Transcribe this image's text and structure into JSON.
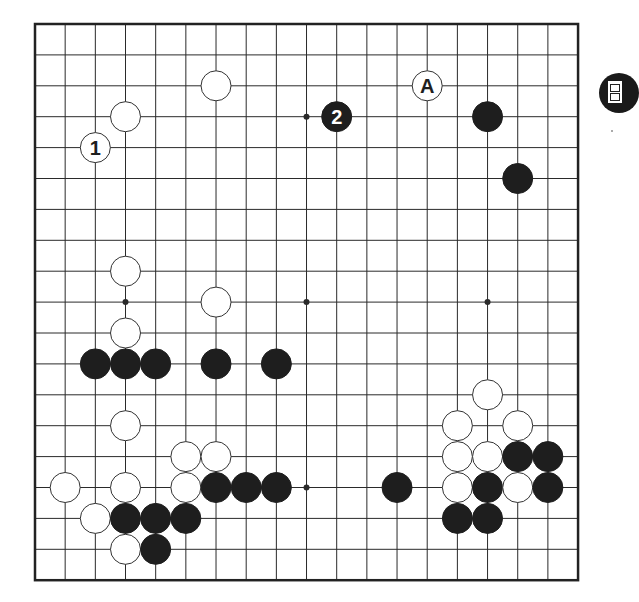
{
  "board": {
    "size": 19,
    "origin_x": 35,
    "origin_y": 24,
    "spacing_x": 30.17,
    "spacing_y": 30.9,
    "stone_radius": 15,
    "colors": {
      "line": "#2a2a2a",
      "border": "#222222",
      "black_stone": "#1e1e1e",
      "white_stone": "#ffffff",
      "white_stroke": "#333333",
      "background": "#ffffff"
    },
    "star_points": [
      [
        3,
        3
      ],
      [
        9,
        3
      ],
      [
        15,
        3
      ],
      [
        3,
        9
      ],
      [
        9,
        9
      ],
      [
        15,
        9
      ],
      [
        3,
        15
      ],
      [
        9,
        15
      ],
      [
        15,
        15
      ]
    ],
    "stones": [
      {
        "color": "white",
        "col": 6,
        "row": 2
      },
      {
        "color": "white",
        "col": 3,
        "row": 3
      },
      {
        "color": "white",
        "col": 2,
        "row": 4,
        "label": "1"
      },
      {
        "color": "black",
        "col": 10,
        "row": 3,
        "label": "2"
      },
      {
        "color": "white",
        "col": 13,
        "row": 2,
        "label": "A"
      },
      {
        "color": "black",
        "col": 15,
        "row": 3
      },
      {
        "color": "black",
        "col": 16,
        "row": 5
      },
      {
        "color": "white",
        "col": 3,
        "row": 8
      },
      {
        "color": "white",
        "col": 6,
        "row": 9
      },
      {
        "color": "white",
        "col": 3,
        "row": 10
      },
      {
        "color": "black",
        "col": 2,
        "row": 11
      },
      {
        "color": "black",
        "col": 3,
        "row": 11
      },
      {
        "color": "black",
        "col": 4,
        "row": 11
      },
      {
        "color": "black",
        "col": 6,
        "row": 11
      },
      {
        "color": "black",
        "col": 8,
        "row": 11
      },
      {
        "color": "white",
        "col": 15,
        "row": 12
      },
      {
        "color": "white",
        "col": 3,
        "row": 13
      },
      {
        "color": "white",
        "col": 14,
        "row": 13
      },
      {
        "color": "white",
        "col": 16,
        "row": 13
      },
      {
        "color": "white",
        "col": 5,
        "row": 14
      },
      {
        "color": "white",
        "col": 6,
        "row": 14
      },
      {
        "color": "white",
        "col": 14,
        "row": 14
      },
      {
        "color": "white",
        "col": 15,
        "row": 14
      },
      {
        "color": "black",
        "col": 16,
        "row": 14
      },
      {
        "color": "black",
        "col": 17,
        "row": 14
      },
      {
        "color": "white",
        "col": 1,
        "row": 15
      },
      {
        "color": "white",
        "col": 3,
        "row": 15
      },
      {
        "color": "white",
        "col": 5,
        "row": 15
      },
      {
        "color": "black",
        "col": 6,
        "row": 15
      },
      {
        "color": "black",
        "col": 7,
        "row": 15
      },
      {
        "color": "black",
        "col": 8,
        "row": 15
      },
      {
        "color": "black",
        "col": 12,
        "row": 15
      },
      {
        "color": "white",
        "col": 14,
        "row": 15
      },
      {
        "color": "black",
        "col": 15,
        "row": 15
      },
      {
        "color": "white",
        "col": 16,
        "row": 15
      },
      {
        "color": "black",
        "col": 17,
        "row": 15
      },
      {
        "color": "white",
        "col": 2,
        "row": 16
      },
      {
        "color": "black",
        "col": 3,
        "row": 16
      },
      {
        "color": "black",
        "col": 4,
        "row": 16
      },
      {
        "color": "black",
        "col": 5,
        "row": 16
      },
      {
        "color": "black",
        "col": 14,
        "row": 16
      },
      {
        "color": "black",
        "col": 15,
        "row": 16
      },
      {
        "color": "white",
        "col": 3,
        "row": 17
      },
      {
        "color": "black",
        "col": 4,
        "row": 17
      }
    ]
  },
  "side_icon": {
    "name": "book-icon"
  }
}
